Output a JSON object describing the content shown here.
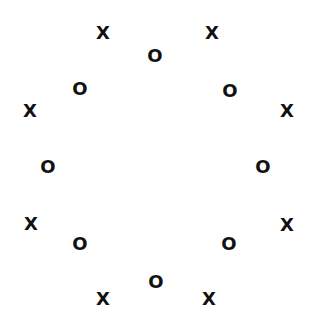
{
  "diagram": {
    "text_color": "#111111",
    "background": "#ffffff",
    "symbols": [
      {
        "label": "X",
        "kind": "x"
      },
      {
        "label": "O",
        "kind": "o"
      },
      {
        "label": "X",
        "kind": "x"
      },
      {
        "label": "O",
        "kind": "o"
      },
      {
        "label": "X",
        "kind": "x"
      },
      {
        "label": "O",
        "kind": "o"
      },
      {
        "label": "X",
        "kind": "x"
      },
      {
        "label": "O",
        "kind": "o"
      },
      {
        "label": "X",
        "kind": "x"
      },
      {
        "label": "O",
        "kind": "o"
      },
      {
        "label": "X",
        "kind": "x"
      },
      {
        "label": "O",
        "kind": "o"
      },
      {
        "label": "X",
        "kind": "x"
      },
      {
        "label": "O",
        "kind": "o"
      },
      {
        "label": "X",
        "kind": "x"
      },
      {
        "label": "O",
        "kind": "o"
      }
    ]
  }
}
